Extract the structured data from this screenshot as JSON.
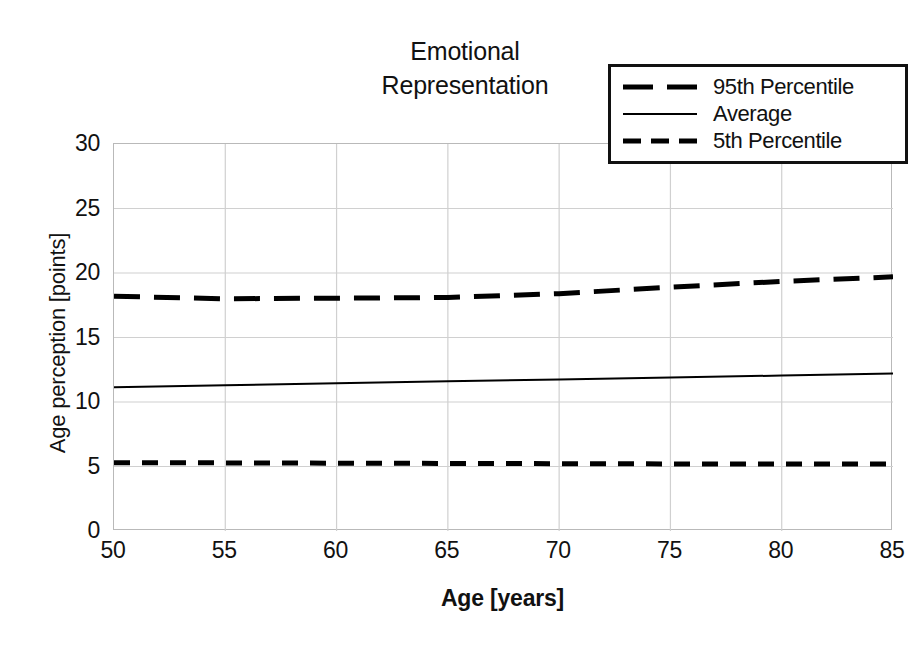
{
  "chart_data": {
    "type": "line",
    "title": "Emotional\nRepresentation",
    "xlabel": "Age [years]",
    "ylabel": "Age perception [points]",
    "xlim": [
      50,
      85
    ],
    "ylim": [
      0,
      30
    ],
    "xticks": [
      50,
      55,
      60,
      65,
      70,
      75,
      80,
      85
    ],
    "yticks": [
      0,
      5,
      10,
      15,
      20,
      25,
      30
    ],
    "grid": true,
    "legend_position": "top-right",
    "x": [
      50,
      55,
      60,
      65,
      70,
      75,
      80,
      85
    ],
    "series": [
      {
        "name": "95th Percentile",
        "style": "long-dash",
        "color": "#000000",
        "width": 5,
        "values": [
          18.2,
          18.0,
          18.05,
          18.1,
          18.4,
          18.9,
          19.35,
          19.7
        ]
      },
      {
        "name": "Average",
        "style": "solid",
        "color": "#000000",
        "width": 2,
        "values": [
          11.15,
          11.3,
          11.45,
          11.6,
          11.75,
          11.9,
          12.05,
          12.2
        ]
      },
      {
        "name": "5th Percentile",
        "style": "short-dash",
        "color": "#000000",
        "width": 5,
        "values": [
          5.3,
          5.28,
          5.26,
          5.24,
          5.22,
          5.2,
          5.2,
          5.2
        ]
      }
    ]
  },
  "legend": {
    "items": [
      {
        "label": "95th Percentile",
        "swatch": "long-dash-line-icon"
      },
      {
        "label": "Average",
        "swatch": "solid-line-icon"
      },
      {
        "label": "5th Percentile",
        "swatch": "short-dash-line-icon"
      }
    ]
  },
  "axes": {
    "y_tick_labels": [
      "30",
      "25",
      "20",
      "15",
      "10",
      "5",
      "0"
    ],
    "x_tick_labels": [
      "50",
      "55",
      "60",
      "65",
      "70",
      "75",
      "80",
      "85"
    ]
  },
  "colors": {
    "line": "#000000",
    "grid": "#d0d0d0",
    "axis": "#b9b9b9",
    "text": "#111111",
    "background": "#ffffff"
  }
}
